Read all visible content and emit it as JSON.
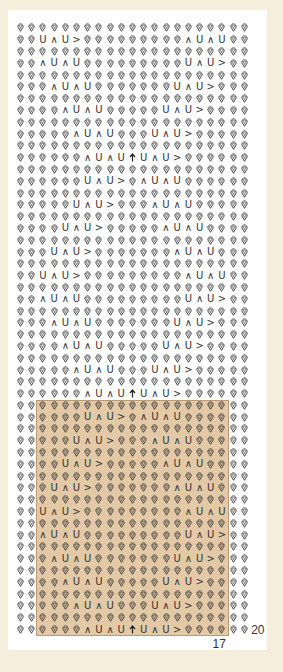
{
  "chart": {
    "columns": 21,
    "rows_total": 52,
    "symbols": {
      "O": "knit-stitch-drop",
      "U": "purl-u",
      "^": "decrease-caret",
      ">": "right-arrow-stitch",
      "A": "central-double-decrease-arrow"
    },
    "rows": [
      "OOOOOOOOOOOOOOOOOOOOO",
      "OOU^U>OOOOOOOOO^U^UOO",
      "OOOOOOOOOOOOOOOOOOOOO",
      "OO^U^UOOOOOOOOOU^U>OO",
      "OOOOOOOOOOOOOOOOOOOOO",
      "OOO^U^UOOOOOOOU^U>OOO",
      "OOOOOOOOOOOOOOOOOOOOO",
      "OOOO^U^UOOOOOU^U>OOOO",
      "OOOOOOOOOOOOOOOOOOOOO",
      "OOOOO^U^UOOOU^U>OOOOO",
      "OOOOOOOOOOOOOOOOOOOOO",
      "OOOOOO^U^UAU^U>OOOOOO",
      "OOOOOOOOOOOOOOOOOOOOO",
      "OOOOOOU^U>O^U^UOOOOOO",
      "OOOOOOOOOOOOOOOOOOOOO",
      "OOOOOU^U>OOO^U^UOOOOO",
      "OOOOOOOOOOOOOOOOOOOOO",
      "OOOOU^U>OOOOO^U^UOOOO",
      "OOOOOOOOOOOOOOOOOOOOO",
      "OOOU^U>OOOOOOO^U^UOOO",
      "OOOOOOOOOOOOOOOOOOOOO",
      "OOU^U>OOOOOOOOO^U^UOO",
      "OOOOOOOOOOOOOOOOOOOOO",
      "OO^U^UOOOOOOOOOU^U>OO",
      "OOOOOOOOOOOOOOOOOOOOO",
      "OOO^U^UOOOOOOOU^U>OOO",
      "OOOOOOOOOOOOOOOOOOOOO",
      "OOOO^U^UOOOOOU^U>OOOO",
      "OOOOOOOOOOOOOOOOOOOOO",
      "OOOOO^U^UOOOU^U>OOOOO",
      "OOOOOOOOOOOOOOOOOOOOO",
      "OOOOOO^U^UAU^U>OOOOOO",
      "OOOOOOOOOOOOOOOOOOOOO",
      "OOOOOOU^U>O^U^UOOOOOO",
      "OOOOOOOOOOOOOOOOOOOOO",
      "OOOOOU^U>OOO^U^UOOOOO",
      "OOOOOOOOOOOOOOOOOOOOO",
      "OOOOU^U>OOOOO^U^UOOOO",
      "OOOOOOOOOOOOOOOOOOOOO",
      "OOOU^U>OOOOOOO^U^UOOO",
      "OOOOOOOOOOOOOOOOOOOOO",
      "OOU^U>OOOOOOOOO^U^UOO",
      "OOOOOOOOOOOOOOOOOOOOO",
      "OO^U^UOOOOOOOOOU^U>OO",
      "OOOOOOOOOOOOOOOOOOOOO",
      "OOO^U^UOOOOOOOU^U>OOO",
      "OOOOOOOOOOOOOOOOOOOOO",
      "OOOO^U^UOOOOOU^U>OOOO",
      "OOOOOOOOOOOOOOOOOOOOO",
      "OOOOO^U^UOOOU^U>OOOOO",
      "OOOOOOOOOOOOOOOOOOOOO",
      "OOOOOO^U^UAU^U>OOOOOO"
    ],
    "highlight": {
      "start_row": 33,
      "end_row": 52,
      "start_col": 3,
      "end_col": 19,
      "color": "#e3c9a6"
    },
    "labels": {
      "width_label": "17",
      "height_label": "20"
    }
  }
}
